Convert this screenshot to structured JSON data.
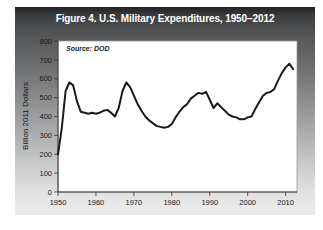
{
  "figure": {
    "title": "Figure 4. U.S. Military Expenditures, 1950–2012",
    "source_note": "Source: DOD",
    "colors": {
      "panel_gradient_top": "#232325",
      "panel_gradient_bottom": "#ececed",
      "title_text": "#ffffff",
      "plot_background": "#ffffff",
      "axis": "#333333",
      "line": "#1a1a1a"
    }
  },
  "chart_data": {
    "type": "line",
    "title": "Figure 4. U.S. Military Expenditures, 1950–2012",
    "source": "Source: DOD",
    "xlabel": "",
    "ylabel": "Billion 2011 Dollars",
    "series_name": "U.S. military expenditures, billion 2011 dollars",
    "xlim": [
      1950,
      2013
    ],
    "ylim": [
      0,
      800
    ],
    "x_ticks": [
      1950,
      1960,
      1970,
      1980,
      1990,
      2000,
      2010
    ],
    "y_ticks": [
      0,
      100,
      200,
      300,
      400,
      500,
      600,
      700,
      800
    ],
    "grid": false,
    "legend_position": "none",
    "line_color": "#1a1a1a",
    "line_width": 2,
    "x": [
      1950,
      1951,
      1952,
      1953,
      1954,
      1955,
      1956,
      1957,
      1958,
      1959,
      1960,
      1961,
      1962,
      1963,
      1964,
      1965,
      1966,
      1967,
      1968,
      1969,
      1970,
      1971,
      1972,
      1973,
      1974,
      1975,
      1976,
      1977,
      1978,
      1979,
      1980,
      1981,
      1982,
      1983,
      1984,
      1985,
      1986,
      1987,
      1988,
      1989,
      1990,
      1991,
      1992,
      1993,
      1994,
      1995,
      1996,
      1997,
      1998,
      1999,
      2000,
      2001,
      2002,
      2003,
      2004,
      2005,
      2006,
      2007,
      2008,
      2009,
      2010,
      2011,
      2012
    ],
    "values": [
      200,
      340,
      535,
      580,
      565,
      480,
      425,
      420,
      415,
      420,
      415,
      420,
      430,
      435,
      420,
      400,
      445,
      535,
      580,
      555,
      510,
      465,
      430,
      400,
      380,
      365,
      350,
      345,
      340,
      345,
      360,
      395,
      425,
      450,
      465,
      495,
      510,
      525,
      520,
      530,
      490,
      445,
      470,
      450,
      430,
      410,
      400,
      395,
      385,
      385,
      395,
      400,
      440,
      475,
      510,
      525,
      530,
      545,
      590,
      630,
      660,
      680,
      650
    ]
  }
}
